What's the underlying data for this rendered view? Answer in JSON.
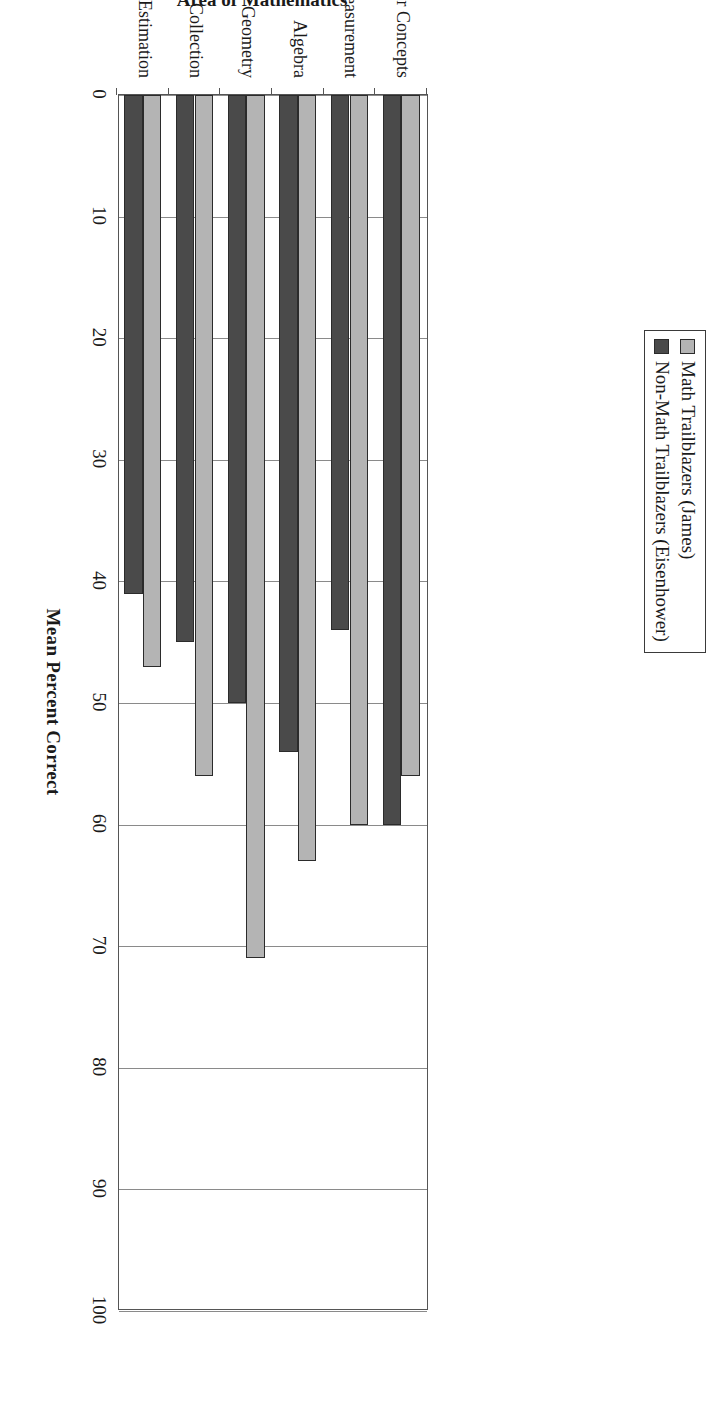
{
  "chart_data": {
    "type": "bar",
    "orientation": "horizontal-rendered-rotated",
    "title": "",
    "xlabel": "Mean Percent Correct",
    "ylabel": "Area of Mathematics",
    "categories": [
      "Number Concepts",
      "Measurement",
      "Algebra",
      "Geometry",
      "Data Collection",
      "Estimation"
    ],
    "series": [
      {
        "name": "Math Trailblazers (James)",
        "color": "#b4b4b4",
        "values": [
          56,
          60,
          63,
          71,
          56,
          47
        ]
      },
      {
        "name": "Non-Math Trailblazers (Eisenhower)",
        "color": "#4a4a4a",
        "values": [
          60,
          44,
          54,
          50,
          45,
          41
        ]
      }
    ],
    "value_axis": {
      "min": 0,
      "max": 100,
      "tick_step": 10,
      "tick_labels": [
        "0",
        "10",
        "20",
        "30",
        "40",
        "50",
        "60",
        "70",
        "80",
        "90",
        "100"
      ],
      "display_order": [
        "100",
        "90",
        "80",
        "70",
        "60",
        "50",
        "40",
        "30",
        "20",
        "10",
        "0"
      ]
    },
    "grid": true,
    "legend_position": "top-center",
    "legend_border": true
  },
  "legend": {
    "entries": [
      {
        "label": "Math Trailblazers (James)",
        "swatch": "#b4b4b4"
      },
      {
        "label": "Non-Math Trailblazers (Eisenhower)",
        "swatch": "#4a4a4a"
      }
    ]
  },
  "axes": {
    "value_title": "Mean Percent Correct",
    "category_title": "Area of Mathematics"
  },
  "colors": {
    "series_light": "#b4b4b4",
    "series_dark": "#4a4a4a",
    "axis": "#555555",
    "grid": "#8a8a8a",
    "text": "#1a1a1a",
    "background": "#ffffff"
  }
}
